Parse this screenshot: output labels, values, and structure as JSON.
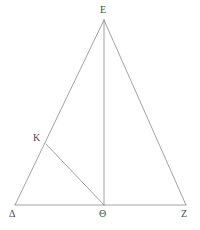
{
  "figure": {
    "background_color": "#ffffff",
    "stroke_color": "#8a8a8a",
    "label_color": "#4a4a4a",
    "stroke_width": 0.8,
    "canvas": {
      "width": 200,
      "height": 230
    }
  },
  "points": [
    {
      "id": "E",
      "label": "E",
      "x": 104,
      "y": 20,
      "label_x": 100,
      "label_y": 5,
      "name": "apex-point-e"
    },
    {
      "id": "Delta",
      "label": "Δ",
      "x": 15,
      "y": 205,
      "label_x": 9,
      "label_y": 209,
      "name": "vertex-point-delta"
    },
    {
      "id": "Theta",
      "label": "Θ",
      "x": 104,
      "y": 205,
      "label_x": 99,
      "label_y": 209,
      "name": "vertex-point-theta"
    },
    {
      "id": "Z",
      "label": "Z",
      "x": 186,
      "y": 205,
      "label_x": 181,
      "label_y": 209,
      "name": "vertex-point-z"
    },
    {
      "id": "K",
      "label": "K",
      "x": 46,
      "y": 144,
      "label_x": 33,
      "label_y": 133,
      "name": "vertex-point-k"
    }
  ],
  "segments": [
    {
      "id": "Delta-E",
      "from": "Delta",
      "to": "E",
      "name": "segment-delta-e"
    },
    {
      "id": "E-Z",
      "from": "E",
      "to": "Z",
      "name": "segment-e-z"
    },
    {
      "id": "Delta-Z",
      "from": "Delta",
      "to": "Z",
      "name": "segment-delta-z"
    },
    {
      "id": "E-Theta",
      "from": "E",
      "to": "Theta",
      "name": "segment-e-theta"
    },
    {
      "id": "K-Theta",
      "from": "K",
      "to": "Theta",
      "name": "segment-k-theta"
    }
  ],
  "labels": {
    "E": "E",
    "Delta": "Δ",
    "Theta": "Θ",
    "Z": "Z",
    "K": "K"
  }
}
